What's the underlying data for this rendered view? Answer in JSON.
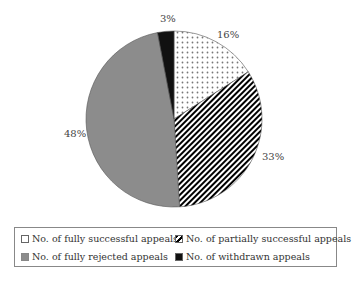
{
  "chart_data": {
    "type": "pie",
    "title": "",
    "categories": [
      "No. of fully successful appeals",
      "No. of partially successful appeals",
      "No. of fully rejected appeals",
      "No. of withdrawn appeals"
    ],
    "values": [
      16,
      33,
      48,
      3
    ],
    "labels": [
      "16%",
      "33%",
      "48%",
      "3%"
    ],
    "patterns": [
      "dots",
      "diagonal-stripes",
      "solid-gray",
      "solid-black"
    ],
    "colors": [
      "#ffffff",
      "#000000",
      "#8c8c8c",
      "#111111"
    ],
    "legend_position": "bottom"
  },
  "legend": {
    "items": [
      {
        "label": "No. of fully successful appeals"
      },
      {
        "label": "No. of partially successful appeals"
      },
      {
        "label": "No. of fully rejected appeals"
      },
      {
        "label": "No. of withdrawn appeals"
      }
    ]
  },
  "labels": {
    "s16": "16%",
    "s33": "33%",
    "s48": "48%",
    "s3": "3%"
  }
}
